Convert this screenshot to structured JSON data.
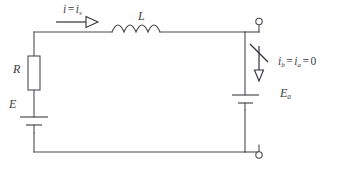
{
  "figure": {
    "type": "electrical-schematic",
    "width": 339,
    "height": 170,
    "background_color": "#ffffff",
    "line_color": "#4a4a52"
  },
  "labels": {
    "current_top": {
      "symbol_1": "i",
      "equals": "=",
      "symbol_2": "i",
      "subscript_2": "s",
      "full_text": "i = iₛ"
    },
    "inductor": "L",
    "resistor": "R",
    "source_left": "E",
    "current_right": {
      "symbol_1": "i",
      "subscript_1": "b",
      "equals_1": "=",
      "symbol_2": "i",
      "subscript_2": "a",
      "equals_2": "=",
      "value": "0",
      "full_text": "iᵦ = iₐ = 0"
    },
    "source_right": {
      "symbol": "E",
      "subscript": "a",
      "full_text": "Eₐ"
    }
  },
  "components": [
    {
      "name": "resistor",
      "label": "R",
      "style": "box",
      "orientation": "vertical"
    },
    {
      "name": "inductor",
      "label": "L",
      "style": "coil",
      "coils": 4,
      "orientation": "horizontal"
    },
    {
      "name": "battery-left",
      "label": "E",
      "style": "cell",
      "orientation": "vertical"
    },
    {
      "name": "battery-right",
      "label": "Ea",
      "style": "cell",
      "orientation": "vertical"
    },
    {
      "name": "current-arrow-top",
      "direction": "right",
      "crossed_out": false
    },
    {
      "name": "current-arrow-right",
      "direction": "down",
      "crossed_out": true
    },
    {
      "name": "terminal-top",
      "style": "open-circle"
    },
    {
      "name": "terminal-bottom",
      "style": "open-circle"
    }
  ]
}
